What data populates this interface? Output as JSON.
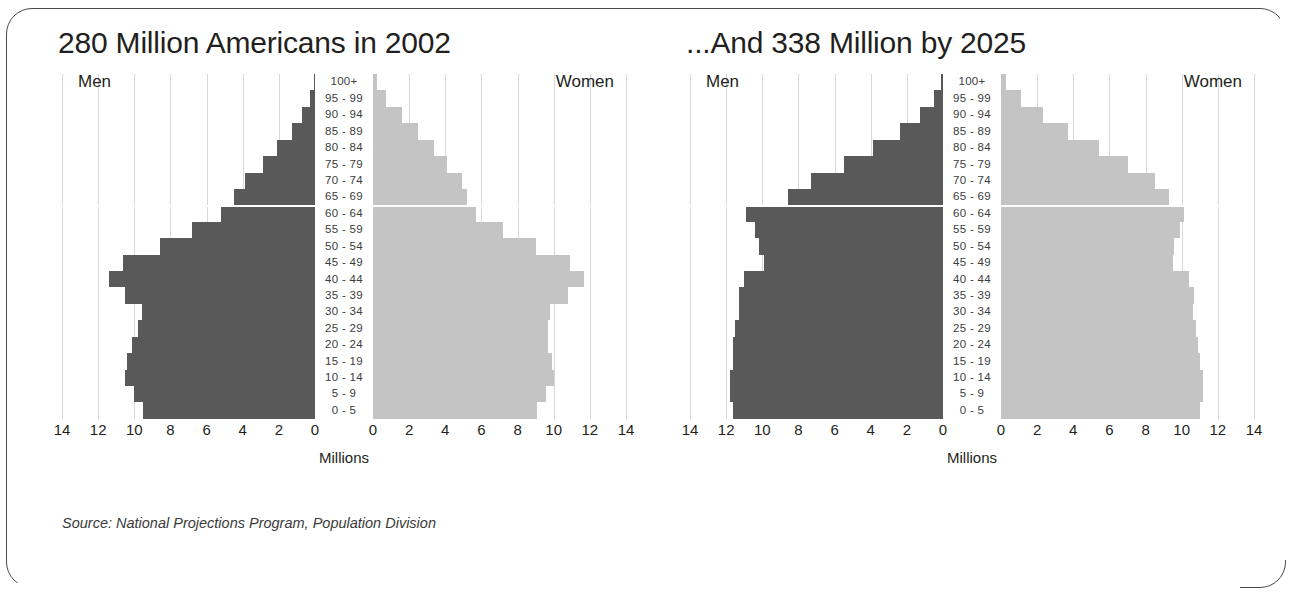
{
  "figure": {
    "source_note": "Source:  National Projections Program, Population Division",
    "colors": {
      "men_bar": "#595959",
      "women_bar": "#c4c4c4",
      "gridline": "#d8d8d8",
      "text": "#231f20",
      "frame": "#4a4a4a"
    }
  },
  "panels": [
    {
      "id": "panel-2002",
      "title": "280 Million Americans in 2002",
      "men_label": "Men",
      "women_label": "Women",
      "axis_title": "Millions"
    },
    {
      "id": "panel-2025",
      "title": "...And 338 Million by 2025",
      "men_label": "Men",
      "women_label": "Women",
      "axis_title": "Millions"
    }
  ],
  "axis": {
    "left_ticks": [
      "14",
      "12",
      "10",
      "8",
      "6",
      "4",
      "2",
      "0"
    ],
    "right_ticks": [
      "0",
      "2",
      "4",
      "6",
      "8",
      "10",
      "12",
      "14"
    ],
    "tick_values": [
      14,
      12,
      10,
      8,
      6,
      4,
      2,
      0
    ],
    "max": 14,
    "units": "Millions"
  },
  "chart_data": [
    {
      "type": "bar",
      "subtype": "population-pyramid",
      "title": "280 Million Americans in 2002",
      "xlabel": "Millions",
      "ylabel": "Age group",
      "xlim": [
        0,
        14
      ],
      "grid": true,
      "legend_position": "inline-headings",
      "categories": [
        "100+",
        "95 - 99",
        "90 - 94",
        "85 - 89",
        "80 - 84",
        "75 - 79",
        "70 - 74",
        "65 - 69",
        "60 - 64",
        "55 - 59",
        "50 - 54",
        "45 - 49",
        "40 - 44",
        "35 - 39",
        "30 - 34",
        "25 - 29",
        "20 - 24",
        "15 - 19",
        "10 - 14",
        "5 - 9",
        "0 - 5"
      ],
      "series": [
        {
          "name": "Men",
          "side": "left",
          "color": "#595959",
          "values": [
            0.05,
            0.3,
            0.7,
            1.3,
            2.1,
            2.9,
            3.9,
            4.5,
            5.2,
            6.8,
            8.6,
            10.6,
            11.4,
            10.5,
            9.6,
            9.8,
            10.1,
            10.4,
            10.5,
            10.0,
            9.5
          ]
        },
        {
          "name": "Women",
          "side": "right",
          "color": "#c4c4c4",
          "values": [
            0.2,
            0.7,
            1.6,
            2.5,
            3.4,
            4.1,
            4.9,
            5.2,
            5.7,
            7.2,
            9.0,
            10.9,
            11.7,
            10.8,
            9.8,
            9.7,
            9.7,
            9.9,
            10.0,
            9.6,
            9.1
          ]
        }
      ]
    },
    {
      "type": "bar",
      "subtype": "population-pyramid",
      "title": "...And 338 Million by 2025",
      "xlabel": "Millions",
      "ylabel": "Age group",
      "xlim": [
        0,
        14
      ],
      "grid": true,
      "legend_position": "inline-headings",
      "categories": [
        "100+",
        "95 - 99",
        "90 - 94",
        "85 - 89",
        "80 - 84",
        "75 - 79",
        "70 - 74",
        "65 - 69",
        "60 - 64",
        "55 - 59",
        "50 - 54",
        "45 - 49",
        "40 - 44",
        "35 - 39",
        "30 - 34",
        "25 - 29",
        "20 - 24",
        "15 - 19",
        "10 - 14",
        "5 - 9",
        "0 - 5"
      ],
      "series": [
        {
          "name": "Men",
          "side": "left",
          "color": "#595959",
          "values": [
            0.1,
            0.5,
            1.3,
            2.4,
            3.9,
            5.5,
            7.3,
            8.6,
            10.9,
            10.4,
            10.2,
            9.9,
            11.0,
            11.3,
            11.3,
            11.5,
            11.6,
            11.6,
            11.8,
            11.8,
            11.6
          ]
        },
        {
          "name": "Women",
          "side": "right",
          "color": "#c4c4c4",
          "values": [
            0.3,
            1.1,
            2.3,
            3.7,
            5.4,
            7.0,
            8.5,
            9.3,
            10.1,
            9.9,
            9.6,
            9.5,
            10.4,
            10.7,
            10.6,
            10.8,
            10.9,
            11.0,
            11.2,
            11.2,
            11.0
          ]
        }
      ]
    }
  ]
}
